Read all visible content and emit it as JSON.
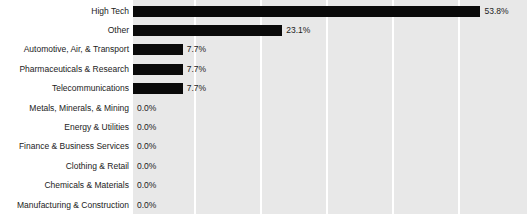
{
  "chart_data": {
    "type": "bar",
    "orientation": "horizontal",
    "title": "",
    "subtitle": "",
    "xlabel": "",
    "ylabel": "",
    "xlim": [
      0,
      61
    ],
    "grid": true,
    "grid_axis": "x",
    "legend": false,
    "legend_position": "none",
    "value_suffix": "%",
    "categories": [
      "High Tech",
      "Other",
      "Automotive, Air, & Transport",
      "Pharmaceuticals & Research",
      "Telecommunications",
      "Metals, Minerals, & Mining",
      "Energy & Utilities",
      "Finance & Business Services",
      "Clothing & Retail",
      "Chemicals & Materials",
      "Manufacturing & Construction"
    ],
    "values": [
      53.8,
      23.1,
      7.7,
      7.7,
      7.7,
      0.0,
      0.0,
      0.0,
      0.0,
      0.0,
      0.0
    ],
    "value_labels": [
      "53.8%",
      "23.1%",
      "7.7%",
      "7.7%",
      "7.7%",
      "0.0%",
      "0.0%",
      "0.0%",
      "0.0%",
      "0.0%",
      "0.0%"
    ],
    "xticks": [],
    "xtick_labels": [],
    "gridline_fractions": [
      0.155,
      0.323,
      0.49,
      0.658,
      0.825
    ],
    "colors": {
      "bar": "#0a0a0a",
      "plot_background": "#e8e8e8",
      "gridline": "#ffffff",
      "figure_background": "#ffffff",
      "text": "#222222"
    }
  }
}
